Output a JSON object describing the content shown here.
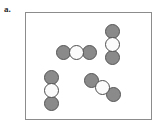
{
  "figure": {
    "panel_label": "a.",
    "label_color": "#2a2a2a",
    "container": {
      "name": "reaction-vessel",
      "x": 25,
      "y": 12,
      "width": 127,
      "height": 108,
      "border_color": "#8c8c8c",
      "fill_color": "#ffffff"
    },
    "atom_types": {
      "gray": {
        "name": "gray-atom",
        "fill": "#8a8a8a",
        "stroke": "#565656"
      },
      "white": {
        "name": "white-atom",
        "fill": "#fbfbfb",
        "stroke": "#4e4e4e"
      }
    },
    "atom_diameter": 15,
    "molecules": [
      {
        "id": "molecule-horizontal",
        "orientation": "horizontal",
        "atoms": [
          {
            "type": "gray",
            "cx": 63,
            "cy": 52
          },
          {
            "type": "white",
            "cx": 76,
            "cy": 52
          },
          {
            "type": "gray",
            "cx": 89,
            "cy": 52
          }
        ]
      },
      {
        "id": "molecule-vertical-right",
        "orientation": "vertical",
        "atoms": [
          {
            "type": "gray",
            "cx": 112,
            "cy": 31
          },
          {
            "type": "white",
            "cx": 112,
            "cy": 44
          },
          {
            "type": "gray",
            "cx": 112,
            "cy": 57
          }
        ]
      },
      {
        "id": "molecule-vertical-left",
        "orientation": "vertical",
        "atoms": [
          {
            "type": "gray",
            "cx": 51,
            "cy": 77
          },
          {
            "type": "white",
            "cx": 51,
            "cy": 90
          },
          {
            "type": "gray",
            "cx": 51,
            "cy": 103
          }
        ]
      },
      {
        "id": "molecule-diagonal",
        "orientation": "diagonal",
        "atoms": [
          {
            "type": "gray",
            "cx": 91,
            "cy": 80
          },
          {
            "type": "white",
            "cx": 102,
            "cy": 87
          },
          {
            "type": "gray",
            "cx": 113,
            "cy": 94
          }
        ]
      }
    ],
    "counts": {
      "molecules_total": 4,
      "gray_atoms_total": 8,
      "white_atoms_total": 4
    }
  }
}
